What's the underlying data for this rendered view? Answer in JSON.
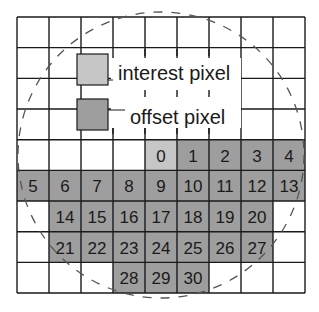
{
  "diagram": {
    "grid": {
      "cols": 9,
      "rows": 9,
      "x0": 17,
      "y0": 17,
      "cell_w": 32,
      "cell_h": 30.67,
      "line_color": "#1a1a1a"
    },
    "colors": {
      "interest": "#c6c6c6",
      "offset": "#9e9e9e",
      "circle": "#555555"
    },
    "legend": {
      "interest_label": "interest pixel",
      "offset_label": "offset pixel"
    },
    "cells": [
      {
        "label": "0",
        "row": 4,
        "col": 4,
        "type": "interest"
      },
      {
        "label": "1",
        "row": 4,
        "col": 5,
        "type": "offset"
      },
      {
        "label": "2",
        "row": 4,
        "col": 6,
        "type": "offset"
      },
      {
        "label": "3",
        "row": 4,
        "col": 7,
        "type": "offset"
      },
      {
        "label": "4",
        "row": 4,
        "col": 8,
        "type": "offset"
      },
      {
        "label": "5",
        "row": 5,
        "col": 0,
        "type": "offset"
      },
      {
        "label": "6",
        "row": 5,
        "col": 1,
        "type": "offset"
      },
      {
        "label": "7",
        "row": 5,
        "col": 2,
        "type": "offset"
      },
      {
        "label": "8",
        "row": 5,
        "col": 3,
        "type": "offset"
      },
      {
        "label": "9",
        "row": 5,
        "col": 4,
        "type": "offset"
      },
      {
        "label": "10",
        "row": 5,
        "col": 5,
        "type": "offset"
      },
      {
        "label": "11",
        "row": 5,
        "col": 6,
        "type": "offset"
      },
      {
        "label": "12",
        "row": 5,
        "col": 7,
        "type": "offset"
      },
      {
        "label": "13",
        "row": 5,
        "col": 8,
        "type": "offset"
      },
      {
        "label": "14",
        "row": 6,
        "col": 1,
        "type": "offset"
      },
      {
        "label": "15",
        "row": 6,
        "col": 2,
        "type": "offset"
      },
      {
        "label": "16",
        "row": 6,
        "col": 3,
        "type": "offset"
      },
      {
        "label": "17",
        "row": 6,
        "col": 4,
        "type": "offset"
      },
      {
        "label": "18",
        "row": 6,
        "col": 5,
        "type": "offset"
      },
      {
        "label": "19",
        "row": 6,
        "col": 6,
        "type": "offset"
      },
      {
        "label": "20",
        "row": 6,
        "col": 7,
        "type": "offset"
      },
      {
        "label": "21",
        "row": 7,
        "col": 1,
        "type": "offset"
      },
      {
        "label": "22",
        "row": 7,
        "col": 2,
        "type": "offset"
      },
      {
        "label": "23",
        "row": 7,
        "col": 3,
        "type": "offset"
      },
      {
        "label": "24",
        "row": 7,
        "col": 4,
        "type": "offset"
      },
      {
        "label": "25",
        "row": 7,
        "col": 5,
        "type": "offset"
      },
      {
        "label": "26",
        "row": 7,
        "col": 6,
        "type": "offset"
      },
      {
        "label": "27",
        "row": 7,
        "col": 7,
        "type": "offset"
      },
      {
        "label": "28",
        "row": 8,
        "col": 3,
        "type": "offset"
      },
      {
        "label": "29",
        "row": 8,
        "col": 4,
        "type": "offset"
      },
      {
        "label": "30",
        "row": 8,
        "col": 5,
        "type": "offset"
      }
    ]
  }
}
